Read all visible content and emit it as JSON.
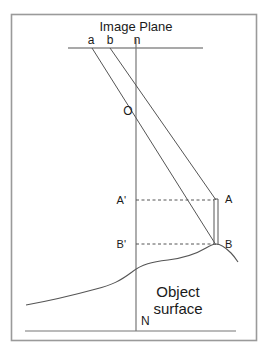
{
  "figure": {
    "title": "Image Plane",
    "labels": {
      "image_plane": "Image Plane",
      "mark_a": "a",
      "mark_b": "b",
      "mark_n": "n",
      "perspective_center": "O",
      "point_a_prime": "A'",
      "point_b_prime": "B'",
      "point_a": "A",
      "point_b": "B",
      "nadir": "N",
      "object_surface_line1": "Object",
      "object_surface_line2": "surface"
    },
    "colors": {
      "border": "#999999",
      "line": "#555555",
      "dashed": "#555555",
      "text": "#1a1a1a",
      "background": "#ffffff"
    },
    "geometry": {
      "image_plane_y": 48,
      "optical_center_x": 136,
      "optical_center_y": 107,
      "a_x": 92,
      "b_x": 110,
      "n_x": 136,
      "a_prime_y": 200,
      "b_prime_y": 244,
      "object_column_x": 216,
      "datum_y": 331
    }
  }
}
